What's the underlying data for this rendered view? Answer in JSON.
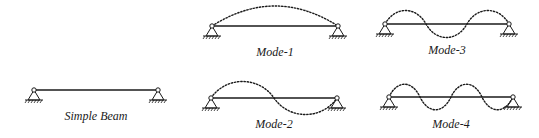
{
  "diagram": {
    "simple_beam": {
      "label": "Simple Beam"
    },
    "modes": [
      {
        "label": "Mode-1",
        "half_waves": 1
      },
      {
        "label": "Mode-2",
        "half_waves": 2
      },
      {
        "label": "Mode-3",
        "half_waves": 3
      },
      {
        "label": "Mode-4",
        "half_waves": 4
      }
    ]
  },
  "colors": {
    "line": "#1a1a1a",
    "background": "#ffffff"
  }
}
